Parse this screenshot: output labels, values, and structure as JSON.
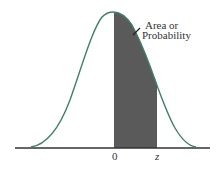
{
  "diagram": {
    "type": "normal-curve",
    "annotation": {
      "line1": "Area or",
      "line2": "Probability"
    },
    "axis_labels": {
      "zero": "0",
      "z": "z"
    },
    "colors": {
      "curve": "#3f7f6e",
      "shade": "#5a5a5a",
      "axis": "#333333",
      "background": "#ffffff"
    },
    "shaded_region": {
      "from": "0",
      "to": "z"
    }
  }
}
